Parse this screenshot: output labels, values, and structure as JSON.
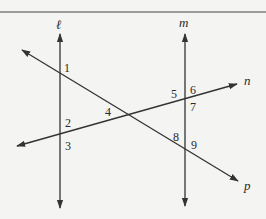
{
  "diagram": {
    "type": "geometry-transversals",
    "lines": {
      "l": {
        "label": "ℓ",
        "orientation": "vertical",
        "x": 60
      },
      "m": {
        "label": "m",
        "orientation": "vertical",
        "x": 185
      },
      "n": {
        "label": "n",
        "orientation": "oblique rising"
      },
      "p": {
        "label": "p",
        "orientation": "oblique falling"
      }
    },
    "angles": [
      "1",
      "2",
      "3",
      "4",
      "5",
      "6",
      "7",
      "8",
      "9"
    ],
    "colors": {
      "background": "#f4f4f2",
      "ink": "#333333"
    }
  }
}
